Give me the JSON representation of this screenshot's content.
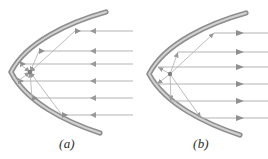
{
  "figure": {
    "background_color": "#ffffff",
    "mirror_color": "#9a9a9a",
    "mirror_core_color": "#cfcfcf",
    "ray_color": "#a8a8a8",
    "reflected_ray_color": "#b0b0b0",
    "arrow_color": "#8f8f8f",
    "label_color": "#2b2b2b",
    "focus_color": "#8a8a8a"
  },
  "panels": [
    {
      "id": "a",
      "label": "(a)",
      "description": "Parabolic mirror with incoming parallel rays converging at the focus",
      "ray_direction": "incoming-left",
      "arrow_direction": "left",
      "focus": {
        "x": 30,
        "y": 72
      },
      "vertex": {
        "x": 11,
        "y": 72
      },
      "mirror": {
        "top_end": {
          "x": 106,
          "y": 12
        },
        "bottom_end": {
          "x": 100,
          "y": 133
        },
        "thickness": 4
      },
      "rays": [
        {
          "y": 31,
          "hit_x": 75,
          "start_x": 133
        },
        {
          "y": 51,
          "hit_x": 39,
          "start_x": 133
        },
        {
          "y": 64,
          "hit_x": 20,
          "start_x": 133
        },
        {
          "y": 81,
          "hit_x": 18,
          "start_x": 133
        },
        {
          "y": 98,
          "hit_x": 32,
          "start_x": 133
        },
        {
          "y": 115,
          "hit_x": 62,
          "start_x": 133
        }
      ]
    },
    {
      "id": "b",
      "label": "(b)",
      "description": "Parabolic mirror with rays from the focus reflecting into a parallel beam",
      "ray_direction": "outgoing-right",
      "arrow_direction": "right",
      "focus": {
        "x": 36,
        "y": 74
      },
      "vertex": {
        "x": 15,
        "y": 74
      },
      "mirror": {
        "top_end": {
          "x": 112,
          "y": 13
        },
        "bottom_end": {
          "x": 106,
          "y": 135
        },
        "thickness": 4
      },
      "rays": [
        {
          "y": 33,
          "hit_x": 80,
          "start_x": 134
        },
        {
          "y": 52,
          "hit_x": 44,
          "start_x": 134
        },
        {
          "y": 67,
          "hit_x": 24,
          "start_x": 134
        },
        {
          "y": 84,
          "hit_x": 23,
          "start_x": 134
        },
        {
          "y": 101,
          "hit_x": 37,
          "start_x": 134
        },
        {
          "y": 118,
          "hit_x": 67,
          "start_x": 134
        }
      ]
    }
  ]
}
